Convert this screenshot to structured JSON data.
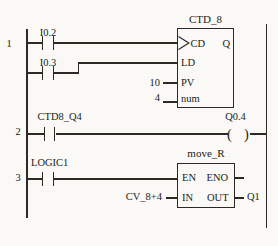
{
  "colors": {
    "background": "#faf9f6",
    "line": "#2d2a26",
    "text": "#201d19"
  },
  "rung1": {
    "number": "1",
    "contact1_label": "I0.2",
    "contact2_label": "I0.3",
    "counter_block": {
      "title": "CTD_8",
      "pin_cd": "CD",
      "pin_ld": "LD",
      "pin_pv": "PV",
      "pin_num": "num",
      "pin_q": "Q",
      "pv_value": "10",
      "num_value": "4"
    }
  },
  "rung2": {
    "number": "2",
    "contact_label": "CTD8_Q4",
    "coil_label": "Q0.4",
    "coil_open": "(",
    "coil_close": ")"
  },
  "rung3": {
    "number": "3",
    "contact_label": "LOGIC1",
    "move_block": {
      "title": "move_R",
      "pin_en": "EN",
      "pin_eno": "ENO",
      "pin_in": "IN",
      "pin_out": "OUT",
      "in_value": "CV_8+4",
      "out_value": "Q1"
    }
  }
}
